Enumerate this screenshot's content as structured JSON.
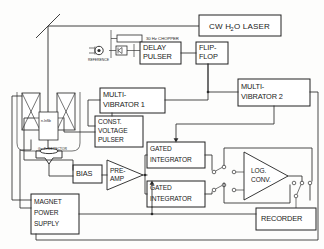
{
  "figure": {
    "type": "apparatus-block-diagram"
  },
  "blocks": {
    "laser": {
      "label": "CW H",
      "sub": "2",
      "label2": "O LASER"
    },
    "chopper": {
      "label": "30 Hz CHOPPER"
    },
    "reference": {
      "label": "REFERENCE"
    },
    "delay_pulser": {
      "line1": "DELAY",
      "line2": "PULSER"
    },
    "flip_flop": {
      "line1": "FLIP-",
      "line2": "FLOP"
    },
    "multivibrator1": {
      "line1": "MULTI-",
      "line2": "VIBRATOR 1"
    },
    "multivibrator2": {
      "line1": "MULTI-",
      "line2": "VIBRATOR 2"
    },
    "const_voltage_pulser": {
      "line1": "CONST.",
      "line2": "VOLTAGE",
      "line3": "PULSER"
    },
    "sample": {
      "label": "n-InSb"
    },
    "detector": {
      "label": "Ge:Zn DETECTOR"
    },
    "bias": {
      "label": "BIAS"
    },
    "preamp": {
      "line1": "PRE-",
      "line2": "AMP"
    },
    "gated_integrator_1": {
      "line1": "GATED",
      "line2": "INTEGRATOR"
    },
    "gated_integrator_2": {
      "line1": "GATED",
      "line2": "INTEGRATOR"
    },
    "log_conv": {
      "line1": "LOG.",
      "line2": "CONV."
    },
    "recorder": {
      "label": "RECORDER"
    },
    "magnet_power_supply": {
      "line1": "MAGNET",
      "line2": "POWER",
      "line3": "SUPPLY"
    }
  },
  "colors": {
    "ink": "#222222",
    "wire": "#2b2b2b",
    "paper": "#fdfdfc"
  }
}
